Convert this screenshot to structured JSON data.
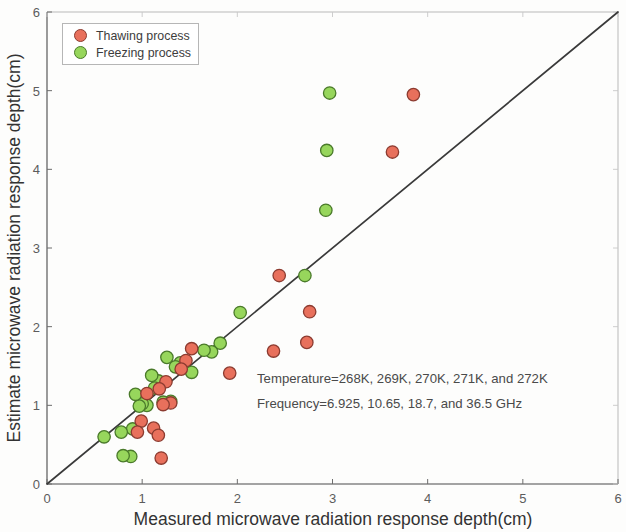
{
  "chart_data": {
    "type": "scatter",
    "title": "",
    "xlabel": "Measured microwave radiation response depth(cm)",
    "ylabel": "Estimate microwave radiation response depth(cm)",
    "xlim": [
      0,
      6
    ],
    "ylim": [
      0,
      6
    ],
    "xticks": [
      0,
      1,
      2,
      3,
      4,
      5,
      6
    ],
    "yticks": [
      0,
      1,
      2,
      3,
      4,
      5,
      6
    ],
    "xticklabels": [
      "0",
      "1",
      "2",
      "3",
      "4",
      "5",
      "6"
    ],
    "yticklabels": [
      "0",
      "1",
      "2",
      "3",
      "4",
      "5",
      "6"
    ],
    "grid": false,
    "legend_position": "upper left",
    "reference_line": {
      "name": "1:1 identity line",
      "from": [
        0,
        0
      ],
      "to": [
        6,
        6
      ]
    },
    "annotations": [
      "Temperature=268K, 269K, 270K, 271K, and 272K",
      "Frequency=6.925, 10.65, 18.7, and 36.5 GHz"
    ],
    "series": [
      {
        "name": "Thawing process",
        "color": "#e8705c",
        "edge_color": "#8c3b30",
        "marker": "circle",
        "points": [
          [
            3.85,
            4.95
          ],
          [
            3.63,
            4.22
          ],
          [
            2.76,
            2.19
          ],
          [
            2.44,
            2.65
          ],
          [
            2.73,
            1.8
          ],
          [
            2.38,
            1.69
          ],
          [
            1.92,
            1.41
          ],
          [
            1.52,
            1.72
          ],
          [
            1.46,
            1.57
          ],
          [
            1.41,
            1.46
          ],
          [
            1.25,
            1.3
          ],
          [
            1.18,
            1.21
          ],
          [
            1.3,
            1.03
          ],
          [
            1.22,
            1.01
          ],
          [
            1.05,
            1.15
          ],
          [
            1.12,
            0.71
          ],
          [
            1.17,
            0.62
          ],
          [
            1.2,
            0.33
          ],
          [
            0.99,
            0.8
          ],
          [
            0.95,
            0.66
          ]
        ]
      },
      {
        "name": "Freezing process",
        "color": "#97d65c",
        "edge_color": "#4a7a2a",
        "marker": "circle",
        "points": [
          [
            2.97,
            4.97
          ],
          [
            2.94,
            4.24
          ],
          [
            2.93,
            3.48
          ],
          [
            2.71,
            2.65
          ],
          [
            2.03,
            2.18
          ],
          [
            1.82,
            1.79
          ],
          [
            1.73,
            1.68
          ],
          [
            1.65,
            1.7
          ],
          [
            1.52,
            1.42
          ],
          [
            1.4,
            1.54
          ],
          [
            1.35,
            1.49
          ],
          [
            1.26,
            1.61
          ],
          [
            1.3,
            1.05
          ],
          [
            1.22,
            1.04
          ],
          [
            1.17,
            1.31
          ],
          [
            1.13,
            1.22
          ],
          [
            1.1,
            1.38
          ],
          [
            1.05,
            1.0
          ],
          [
            1.0,
            1.02
          ],
          [
            0.97,
            0.99
          ],
          [
            0.93,
            1.14
          ],
          [
            0.9,
            0.7
          ],
          [
            0.88,
            0.35
          ],
          [
            0.8,
            0.36
          ],
          [
            0.78,
            0.66
          ],
          [
            0.6,
            0.6
          ]
        ]
      }
    ]
  },
  "legend": {
    "items": [
      {
        "label": "Thawing process",
        "color": "#e8705c"
      },
      {
        "label": "Freezing process",
        "color": "#97d65c"
      }
    ]
  }
}
